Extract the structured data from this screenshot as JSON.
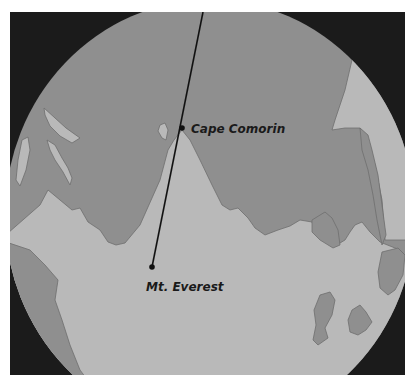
{
  "map": {
    "colors": {
      "frame": "#1b1b1b",
      "sea": "#8f8f8f",
      "land": "#b9b9b9",
      "coast": "#6f6f6f",
      "line": "#111111"
    },
    "labels": {
      "cape_comorin": "Cape Comorin",
      "mt_everest": "Mt. Everest"
    },
    "points": {
      "cape_comorin": {
        "x": 182,
        "y": 128
      },
      "mt_everest": {
        "x": 152,
        "y": 267
      }
    }
  }
}
